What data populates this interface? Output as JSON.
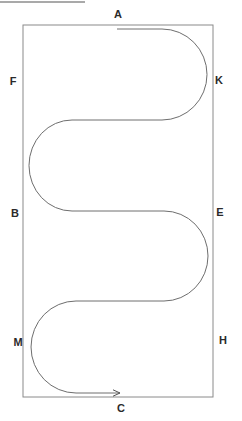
{
  "diagram": {
    "type": "track-path",
    "colors": {
      "background": "#ffffff",
      "rectangle_stroke": "#8a8a8a",
      "path_stroke": "#6e6e6e",
      "label_color": "#2a2a2a",
      "header_line": "#555555"
    },
    "rectangle": {
      "x1": 23,
      "y1": 25,
      "x2": 213,
      "y2": 397
    },
    "path": {
      "start": [
        117,
        29
      ],
      "end": [
        121,
        393
      ],
      "arrow_at_end": true,
      "d": "M117,29 L162,29 A45,45.5 0 0 1 162,120 L72,120 A43,45.5 0 0 0 72,211 L164,211 A44,45 0 0 1 164,301 L76,301 A45,46 0 0 0 76,393 L120,393"
    },
    "labels": [
      {
        "id": "A",
        "text": "A",
        "x": 118,
        "y": 14
      },
      {
        "id": "K",
        "text": "K",
        "x": 219,
        "y": 80
      },
      {
        "id": "F",
        "text": "F",
        "x": 13,
        "y": 81
      },
      {
        "id": "B",
        "text": "B",
        "x": 15,
        "y": 213
      },
      {
        "id": "E",
        "text": "E",
        "x": 220,
        "y": 212
      },
      {
        "id": "M",
        "text": "M",
        "x": 18,
        "y": 342
      },
      {
        "id": "H",
        "text": "H",
        "x": 223,
        "y": 340
      },
      {
        "id": "C",
        "text": "C",
        "x": 121,
        "y": 408
      }
    ],
    "header_line": {
      "x1": 0,
      "y1": 2,
      "x2": 85,
      "y2": 2
    }
  }
}
